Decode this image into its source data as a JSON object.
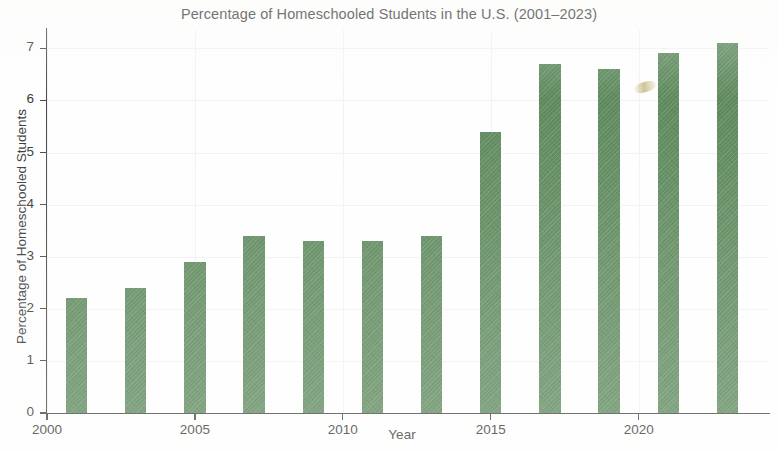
{
  "chart_data": {
    "type": "bar",
    "title": "Percentage of Homeschooled Students in the U.S. (2001–2023)",
    "xlabel": "Year",
    "ylabel": "Percentage of Homeschooled Students",
    "categories": [
      2001,
      2003,
      2005,
      2007,
      2009,
      2011,
      2013,
      2015,
      2017,
      2019,
      2021,
      2023
    ],
    "values": [
      2.2,
      2.4,
      2.9,
      3.4,
      3.3,
      3.3,
      3.4,
      5.4,
      6.7,
      6.6,
      6.9,
      7.1
    ],
    "series": [
      {
        "name": "Percentage of Homeschooled Students",
        "values": [
          2.2,
          2.4,
          2.9,
          3.4,
          3.3,
          3.3,
          3.4,
          5.4,
          6.7,
          6.6,
          6.9,
          7.1
        ]
      }
    ],
    "xlim": [
      2000,
      2024
    ],
    "ylim": [
      0,
      7.35
    ],
    "x_tick_labels": [
      "2000",
      "2005",
      "2010",
      "2015",
      "2020"
    ],
    "x_tick_values": [
      2000,
      2005,
      2010,
      2015,
      2020
    ],
    "y_tick_labels": [
      "0",
      "1",
      "2",
      "3",
      "4",
      "5",
      "6",
      "7"
    ],
    "y_tick_values": [
      0,
      1,
      2,
      3,
      4,
      5,
      6,
      7
    ],
    "grid": true,
    "legend": false,
    "legend_position": "none",
    "bar_color": "#5f8b5e",
    "bar_width_years": 0.72,
    "axis_color": "#4a4a4a",
    "text_color": "#3a3a3a",
    "grid_color": "#f2f2f2",
    "background_color": "#ffffff"
  }
}
